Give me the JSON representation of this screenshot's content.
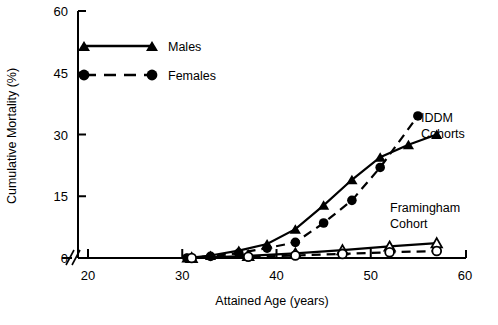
{
  "chart_data": {
    "type": "line",
    "title": "",
    "xlabel": "Attained Age (years)",
    "ylabel": "Cumulative Mortality (%)",
    "xlim": [
      18,
      60
    ],
    "ylim": [
      0,
      60
    ],
    "xticks": [
      20,
      30,
      40,
      50,
      60
    ],
    "yticks": [
      0,
      15,
      30,
      45,
      60
    ],
    "xtick_labels": [
      "20",
      "30",
      "40",
      "50",
      "60"
    ],
    "ytick_labels": [
      "0",
      "15",
      "30",
      "45",
      "60"
    ],
    "grid": false,
    "axis_break": "x-axis break between origin and 20",
    "legend_position": "upper-left-inside",
    "legend": [
      {
        "label": "Males",
        "marker": "filled-triangle",
        "line": "solid"
      },
      {
        "label": "Females",
        "marker": "filled-circle",
        "line": "dashed"
      }
    ],
    "annotations": [
      {
        "text": "IDDM",
        "x": 56.5,
        "y": 34.0
      },
      {
        "text": "Cohorts",
        "x": 56.5,
        "y": 29.5
      },
      {
        "text": "Framingham",
        "x": 52.0,
        "y": 10.5
      },
      {
        "text": "Cohort",
        "x": 52.0,
        "y": 6.5
      }
    ],
    "series": [
      {
        "name": "IDDM Males",
        "group": "IDDM Cohorts",
        "sex": "Males",
        "marker": "filled-triangle",
        "line": "solid",
        "x": [
          30.5,
          33.0,
          36.0,
          39.0,
          42.0,
          45.0,
          48.0,
          51.0,
          54.0,
          57.0
        ],
        "y": [
          0.0,
          0.6,
          1.8,
          3.4,
          7.0,
          12.8,
          19.0,
          24.5,
          27.5,
          30.0
        ]
      },
      {
        "name": "IDDM Females",
        "group": "IDDM Cohorts",
        "sex": "Females",
        "marker": "filled-circle",
        "line": "dashed",
        "x": [
          30.5,
          33.0,
          36.0,
          39.0,
          42.0,
          45.0,
          48.0,
          51.0,
          55.0
        ],
        "y": [
          0.0,
          0.4,
          1.2,
          2.4,
          3.8,
          8.5,
          14.0,
          22.0,
          34.5
        ]
      },
      {
        "name": "Framingham Males",
        "group": "Framingham Cohort",
        "sex": "Males",
        "marker": "open-triangle",
        "line": "solid",
        "x": [
          31.0,
          37.0,
          42.0,
          47.0,
          52.0,
          57.0
        ],
        "y": [
          0.0,
          0.5,
          1.1,
          1.9,
          2.8,
          3.6
        ]
      },
      {
        "name": "Framingham Females",
        "group": "Framingham Cohort",
        "sex": "Females",
        "marker": "open-circle",
        "line": "dashed",
        "x": [
          31.0,
          37.0,
          42.0,
          47.0,
          52.0,
          57.0
        ],
        "y": [
          0.0,
          0.3,
          0.6,
          1.0,
          1.4,
          1.7
        ]
      }
    ]
  }
}
